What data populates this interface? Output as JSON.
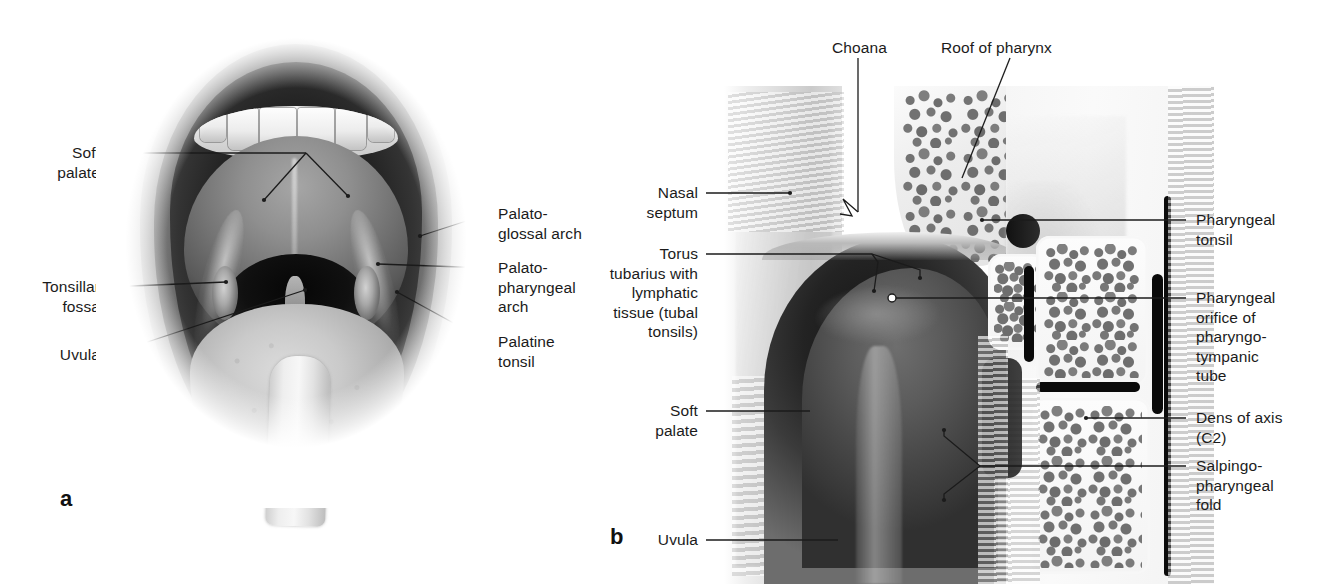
{
  "figure": {
    "type": "anatomical-illustration-pair"
  },
  "panel_a": {
    "marker": "a",
    "labels_left": [
      {
        "name": "soft-palate",
        "text": "Soft\npalate"
      },
      {
        "name": "tonsillar-fossa",
        "text": "Tonsillar\nfossa"
      },
      {
        "name": "uvula",
        "text": "Uvula"
      }
    ],
    "labels_right": [
      {
        "name": "palatoglossal-arch",
        "text": "Palato-\nglossal arch"
      },
      {
        "name": "palatopharyngeal-arch",
        "text": "Palato-\npharyngeal\narch"
      },
      {
        "name": "palatine-tonsil",
        "text": "Palatine\ntonsil"
      }
    ]
  },
  "panel_b": {
    "marker": "b",
    "labels_top": [
      {
        "name": "choana",
        "text": "Choana"
      },
      {
        "name": "roof-of-pharynx",
        "text": "Roof of pharynx"
      }
    ],
    "labels_left": [
      {
        "name": "nasal-septum",
        "text": "Nasal\nseptum"
      },
      {
        "name": "torus-tubarius",
        "text": "Torus\ntubarius with\nlymphatic\ntissue (tubal\ntonsils)"
      },
      {
        "name": "soft-palate",
        "text": "Soft\npalate"
      },
      {
        "name": "uvula",
        "text": "Uvula"
      }
    ],
    "labels_right": [
      {
        "name": "pharyngeal-tonsil",
        "text": "Pharyngeal\ntonsil"
      },
      {
        "name": "pharyngeal-orifice",
        "text": "Pharyngeal\norifice of\npharyngo-\ntympanic\ntube"
      },
      {
        "name": "dens-of-axis",
        "text": "Dens of axis\n(C2)"
      },
      {
        "name": "salpingopharyngeal-fold",
        "text": "Salpingo-\npharyngeal\nfold"
      }
    ]
  },
  "style": {
    "leader_color": "#1b1b1b",
    "text_color": "#1b1b1b",
    "background": "#ffffff"
  }
}
